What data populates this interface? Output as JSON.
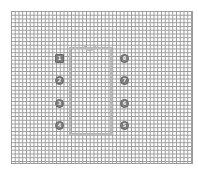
{
  "diagram": {
    "type": "pcb-footprint",
    "package": "DIP-8",
    "grid": {
      "visible": true,
      "color": "#8a8a8a"
    },
    "body_outline_color": "#b9b9b9",
    "pad_color": "#7d7d7d",
    "pins_left": [
      {
        "number": "1",
        "shape": "square"
      },
      {
        "number": "2",
        "shape": "round"
      },
      {
        "number": "3",
        "shape": "round"
      },
      {
        "number": "4",
        "shape": "round"
      }
    ],
    "pins_right": [
      {
        "number": "8",
        "shape": "round"
      },
      {
        "number": "7",
        "shape": "round"
      },
      {
        "number": "6",
        "shape": "round"
      },
      {
        "number": "5",
        "shape": "round"
      }
    ]
  }
}
